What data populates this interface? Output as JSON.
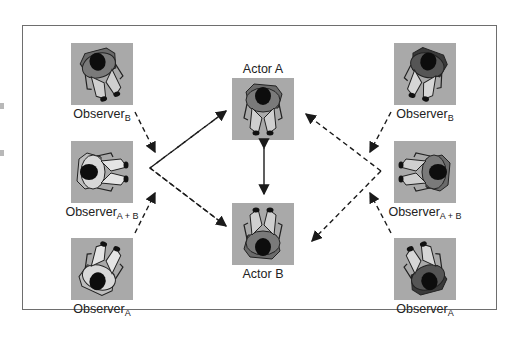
{
  "diagram": {
    "colors": {
      "tile_background": "#a9a9a9",
      "frame_border": "#6e6e6e",
      "arrow": "#1a1a1a",
      "dark_figure_shirt": "#4a4a4a",
      "light_figure_shirt": "#d4d4d4",
      "head": "#111111"
    },
    "actors": [
      {
        "id": "actor-a",
        "label": "Actor A",
        "facing": "down"
      },
      {
        "id": "actor-b",
        "label": "Actor B",
        "facing": "up"
      }
    ],
    "observers_left": [
      {
        "id": "observer-b-left",
        "base": "Observer",
        "sub": "B",
        "arrow_to": "vertex-left"
      },
      {
        "id": "observer-ab-left",
        "base": "Observer",
        "sub": "A + B",
        "arrow_to": "none"
      },
      {
        "id": "observer-a-left",
        "base": "Observer",
        "sub": "A",
        "arrow_to": "vertex-left"
      }
    ],
    "observers_right": [
      {
        "id": "observer-b-right",
        "base": "Observer",
        "sub": "B",
        "arrow_to": "vertex-right"
      },
      {
        "id": "observer-ab-right",
        "base": "Observer",
        "sub": "A + B",
        "arrow_to": "none"
      },
      {
        "id": "observer-a-right",
        "base": "Observer",
        "sub": "A",
        "arrow_to": "vertex-right"
      }
    ],
    "connections": [
      {
        "from": "left-vertex",
        "to": "Actor A",
        "style": "dashed"
      },
      {
        "from": "left-vertex",
        "to": "Actor B",
        "style": "dashed"
      },
      {
        "from": "right-vertex",
        "to": "Actor A",
        "style": "dashed"
      },
      {
        "from": "right-vertex",
        "to": "Actor B",
        "style": "dashed"
      },
      {
        "from": "Actor A",
        "to": "Actor B",
        "style": "solid-double-headed"
      }
    ]
  }
}
